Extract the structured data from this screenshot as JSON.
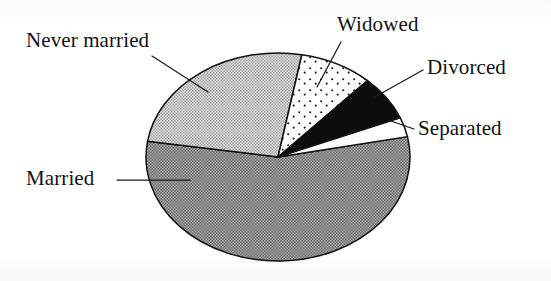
{
  "figure": {
    "type": "pie-chart",
    "title": "",
    "background_color": "#ffffff",
    "outline_color": "#111111"
  },
  "labels": {
    "never_married": "Never married",
    "married": "Married",
    "widowed": "Widowed",
    "divorced": "Divorced",
    "separated": "Separated"
  },
  "chart_data": {
    "type": "pie",
    "title": "",
    "xlabel": "",
    "ylabel": "",
    "legend_position": "callout-labels",
    "grid": false,
    "units": "percent",
    "categories": [
      "Married",
      "Never married",
      "Widowed",
      "Divorced",
      "Separated"
    ],
    "values": [
      55.7,
      25.5,
      9.0,
      7.0,
      2.8
    ],
    "slices": [
      {
        "label": "Married",
        "value": 55.7,
        "fill": "medium-gray-halftone",
        "color": "#8b8b8b",
        "start_angle_deg": 171.3,
        "end_angle_deg": 371.3,
        "sweep_deg": 200.0,
        "leader_line": "horizontal-left"
      },
      {
        "label": "Never married",
        "value": 25.5,
        "fill": "light-gray-halftone",
        "color": "#c3c3c3",
        "start_angle_deg": 79.6,
        "end_angle_deg": 171.3,
        "sweep_deg": 91.7,
        "leader_line": "diagonal-upper-left"
      },
      {
        "label": "Widowed",
        "value": 9.0,
        "fill": "white-with-dots",
        "color": "#ffffff",
        "start_angle_deg": 47.3,
        "end_angle_deg": 79.6,
        "sweep_deg": 32.3,
        "leader_line": "diagonal-upper-right"
      },
      {
        "label": "Divorced",
        "value": 7.0,
        "fill": "solid-black",
        "color": "#0d0d0d",
        "start_angle_deg": 22.1,
        "end_angle_deg": 47.3,
        "sweep_deg": 25.2,
        "leader_line": "diagonal-upper-right"
      },
      {
        "label": "Separated",
        "value": 2.8,
        "fill": "solid-white",
        "color": "#ffffff",
        "start_angle_deg": 11.3,
        "end_angle_deg": 22.1,
        "sweep_deg": 10.8,
        "leader_line": "horizontal-right"
      }
    ],
    "geometry": {
      "center_x": 278,
      "center_y": 157,
      "radius_x": 132,
      "radius_y": 104
    }
  }
}
